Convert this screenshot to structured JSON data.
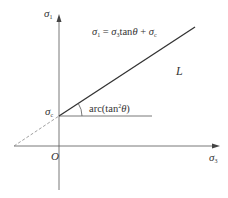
{
  "diagram": {
    "type": "mohr-coulomb-strength-line",
    "axes": {
      "y_label": {
        "symbol": "σ",
        "sub": "1"
      },
      "x_label": {
        "symbol": "σ",
        "sub": "3"
      },
      "origin_label": "O"
    },
    "intercept_label": {
      "symbol": "σ",
      "sub": "c"
    },
    "equation": {
      "lhs_symbol": "σ",
      "lhs_sub": "1",
      "eq": " = ",
      "t1_symbol": "σ",
      "t1_sub": "3",
      "t1_func": "tan",
      "t1_arg": "θ",
      "plus": " + ",
      "t2_symbol": "σ",
      "t2_sub": "c"
    },
    "angle_label": {
      "prefix": "arc(tan",
      "sup": "2",
      "arg": "θ",
      "suffix": ")"
    },
    "line_label": "L",
    "colors": {
      "axis": "#555555",
      "main_line": "#333333",
      "dashed_line": "#888888",
      "text": "#333333"
    }
  }
}
